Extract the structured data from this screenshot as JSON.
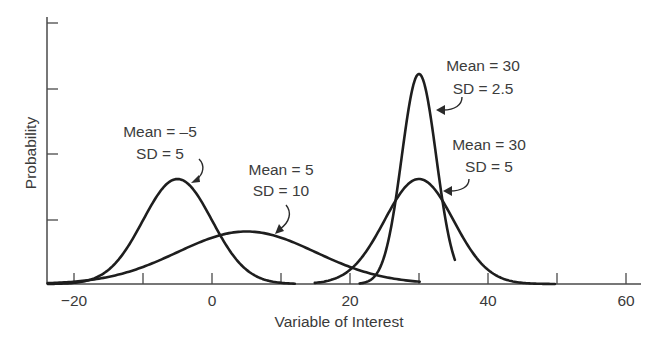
{
  "chart_data": {
    "type": "line",
    "title": "",
    "xlabel": "Variable of Interest",
    "ylabel": "Probability",
    "xlim": [
      -24,
      62
    ],
    "x_ticks": [
      -20,
      -10,
      0,
      10,
      20,
      30,
      40,
      50,
      60
    ],
    "x_tick_labels": [
      "-20",
      "",
      "0",
      "",
      "20",
      "",
      "40",
      "",
      "60"
    ],
    "y_ticks_count": 4,
    "y_tick_labels": [],
    "grid": false,
    "legend": "none (inline annotations with arrows)",
    "series": [
      {
        "name": "Mean = -5, SD = 5",
        "distribution": "normal",
        "mean": -5,
        "sd": 5,
        "x_range": [
          -23.8,
          12
        ],
        "peak_x": -5,
        "annotation": {
          "line1": "Mean = –5",
          "line2": "SD = 5"
        }
      },
      {
        "name": "Mean = 5, SD = 10",
        "distribution": "normal",
        "mean": 5,
        "sd": 10,
        "x_range": [
          -23.8,
          30.1
        ],
        "peak_x": 5,
        "annotation": {
          "line1": "Mean = 5",
          "line2": "SD = 10"
        }
      },
      {
        "name": "Mean = 30, SD = 2.5",
        "distribution": "normal",
        "mean": 30,
        "sd": 2.5,
        "x_range": [
          21.4,
          35.2
        ],
        "peak_x": 30,
        "annotation": {
          "line1": "Mean = 30",
          "line2": "SD = 2.5"
        }
      },
      {
        "name": "Mean = 30, SD = 5",
        "distribution": "normal",
        "mean": 30,
        "sd": 5,
        "x_range": [
          14.9,
          49.7
        ],
        "peak_x": 30,
        "annotation": {
          "line1": "Mean = 30",
          "line2": "SD = 5"
        }
      }
    ]
  },
  "axes": {
    "x_title": "Variable of Interest",
    "y_title": "Probability",
    "x_tick_labels": [
      "−20",
      "0",
      "20",
      "40",
      "60"
    ]
  },
  "annotations": [
    {
      "line1": "Mean = –5",
      "line2": "SD = 5"
    },
    {
      "line1": "Mean = 5",
      "line2": "SD = 10"
    },
    {
      "line1": "Mean = 30",
      "line2": "SD = 2.5"
    },
    {
      "line1": "Mean = 30",
      "line2": "SD = 5"
    }
  ],
  "colors": {
    "curve": "#1e1e1e",
    "axis": "#4a4a4a",
    "text": "#3a3a3a",
    "background": "#ffffff"
  }
}
